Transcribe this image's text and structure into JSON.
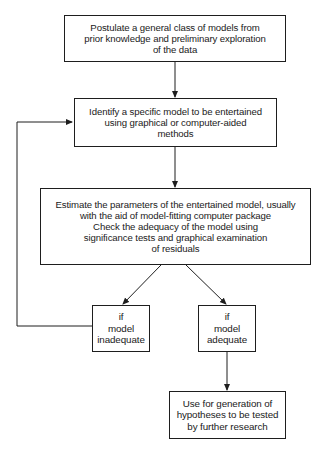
{
  "diagram": {
    "type": "flowchart",
    "colors": {
      "line": "#1e1e1e",
      "text": "#1a1a1a",
      "background": "#ffffff"
    },
    "nodes": [
      {
        "id": "postulate",
        "text": "Postulate a general class of models from\nprior knowledge and preliminary exploration\nof the data"
      },
      {
        "id": "identify",
        "text": "Identify a specific model to be entertained\nusing graphical or computer-aided\nmethods"
      },
      {
        "id": "estimate",
        "text": "Estimate the parameters of the entertained model, usually\nwith the aid of model-fitting computer package\nCheck the adequacy of the model using\nsignificance tests and graphical examination\nof residuals"
      },
      {
        "id": "inadequate",
        "text": "if\nmodel\ninadequate"
      },
      {
        "id": "adequate",
        "text": "if\nmodel\nadequate"
      },
      {
        "id": "use",
        "text": "Use for generation of\nhypotheses to be tested\nby further research"
      }
    ],
    "edges": [
      {
        "from": "postulate",
        "to": "identify"
      },
      {
        "from": "identify",
        "to": "estimate"
      },
      {
        "from": "estimate",
        "to": "inadequate"
      },
      {
        "from": "estimate",
        "to": "adequate"
      },
      {
        "from": "inadequate",
        "to": "identify",
        "label": "loop back"
      },
      {
        "from": "adequate",
        "to": "use"
      }
    ]
  }
}
